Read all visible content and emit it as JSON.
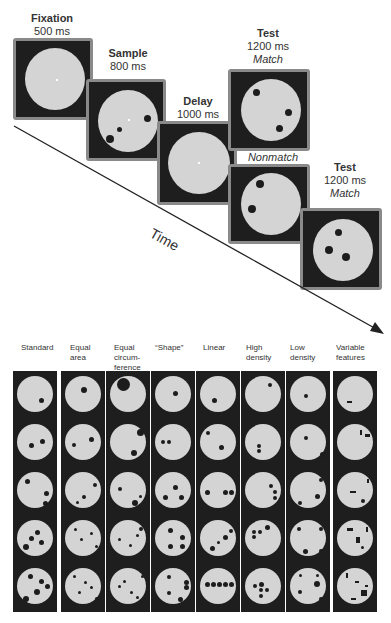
{
  "header_fragment": "",
  "timeline": {
    "axis_label": "Time",
    "panels": [
      {
        "name": "Fixation",
        "duration": "500 ms",
        "condition": ""
      },
      {
        "name": "Sample",
        "duration": "800 ms",
        "condition": ""
      },
      {
        "name": "Delay",
        "duration": "1000 ms",
        "condition": ""
      },
      {
        "name": "Test",
        "duration": "1200 ms",
        "condition": "Match"
      },
      {
        "name": "",
        "duration": "",
        "condition": "Nonmatch"
      },
      {
        "name": "Test",
        "duration": "1200 ms",
        "condition": "Match"
      }
    ]
  },
  "stimulus_grid": {
    "columns": [
      {
        "label": "Standard"
      },
      {
        "label": "Equal area"
      },
      {
        "label": "Equal circum- ference"
      },
      {
        "label": "“Shape”"
      },
      {
        "label": "Linear"
      },
      {
        "label": "High density"
      },
      {
        "label": "Low density"
      },
      {
        "label": "Variable features"
      }
    ],
    "rows": [
      1,
      2,
      3,
      4,
      5
    ]
  },
  "colors": {
    "panel_bg": "#1e1e1e",
    "panel_border": "#8a8a8a",
    "disc": "#d4d4d4",
    "dot": "#1c1c1c"
  }
}
